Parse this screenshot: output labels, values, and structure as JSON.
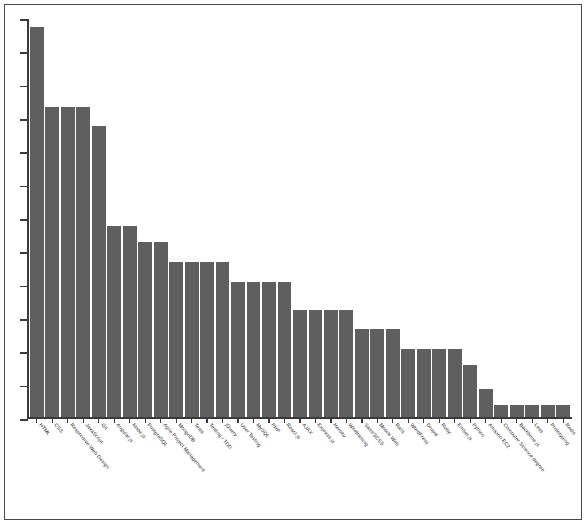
{
  "chart_data": {
    "type": "bar",
    "title": "",
    "xlabel": "",
    "ylabel": "",
    "grid": false,
    "legend": null,
    "axis": {
      "y_tick_count": 13,
      "y_tick_labels": [],
      "ylim": [
        0,
        100
      ],
      "x_tick_marks": true
    },
    "bar_color": "#5f5f5f",
    "categories": [
      "HTML",
      "CSS",
      "Responsive Web Design",
      "JavaScript",
      "Git",
      "Angular.js",
      "Node.js",
      "PostgreSQL",
      "Agile Project Management",
      "MongoDB",
      "Tests",
      "Testing / TDD",
      "jQuery",
      "User Testing",
      "MySQL",
      "PHP",
      "React.js",
      "AJAX",
      "Express.js",
      "Heroku",
      "Wireframing",
      "Sass/SCSS",
      "Mobile Web",
      "Rails",
      "WordPress",
      "Drupal",
      "Ruby",
      "Ember.js",
      "Python",
      "Amazon EC2",
      "Computer Science degree",
      "Backbone.js",
      "Less",
      "Prototyping",
      "Redis"
    ],
    "values": [
      98,
      78,
      78,
      78,
      73,
      48,
      48,
      44,
      44,
      39,
      39,
      39,
      39,
      34,
      34,
      34,
      34,
      27,
      27,
      27,
      27,
      22,
      22,
      22,
      17,
      17,
      17,
      17,
      13,
      7,
      3,
      3,
      3,
      3,
      3
    ]
  }
}
